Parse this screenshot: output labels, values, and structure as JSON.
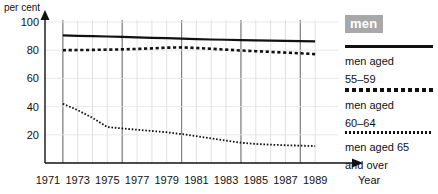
{
  "chart_data": {
    "type": "line",
    "title": "",
    "xlabel": "Year",
    "ylabel": "per cent",
    "ylim": [
      0,
      100
    ],
    "xlim": [
      1971,
      1990
    ],
    "grid": true,
    "legend_position": "right",
    "legend_header": "men",
    "yticks": [
      100,
      80,
      60,
      40,
      20
    ],
    "xticks": [
      1971,
      1973,
      1975,
      1977,
      1979,
      1981,
      1983,
      1985,
      1987,
      1989
    ],
    "x": [
      1972,
      1973,
      1974,
      1975,
      1976,
      1977,
      1978,
      1979,
      1980,
      1981,
      1982,
      1983,
      1984,
      1985,
      1986,
      1987,
      1988,
      1989
    ],
    "series": [
      {
        "name": "men aged 55-59",
        "label": "men aged\n55–59",
        "style": "solid",
        "color": "#111111",
        "values": [
          90.5,
          90.2,
          90.0,
          89.7,
          89.4,
          89.1,
          88.8,
          88.5,
          88.2,
          87.9,
          87.6,
          87.4,
          87.2,
          87.0,
          86.8,
          86.6,
          86.4,
          86.2
        ]
      },
      {
        "name": "men aged 60-64",
        "label": "men aged\n60–64",
        "style": "dashed",
        "color": "#111111",
        "values": [
          80.0,
          80.1,
          80.2,
          80.4,
          80.6,
          80.9,
          81.3,
          81.8,
          82.0,
          81.6,
          81.0,
          80.4,
          79.8,
          79.3,
          78.8,
          78.3,
          77.8,
          77.2
        ]
      },
      {
        "name": "men aged 65 and over",
        "label": "men aged 65\nand over",
        "style": "dotted",
        "color": "#111111",
        "values": [
          42.0,
          37.5,
          32.0,
          25.5,
          24.5,
          23.6,
          22.7,
          21.8,
          20.5,
          19.0,
          17.4,
          15.9,
          14.4,
          13.5,
          13.0,
          12.6,
          12.3,
          12.0
        ]
      }
    ]
  },
  "axis": {
    "y_label": "per cent",
    "x_label": "Year"
  }
}
